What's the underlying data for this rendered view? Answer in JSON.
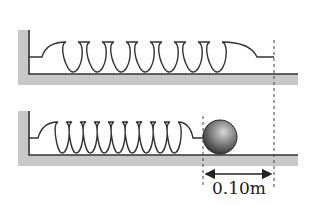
{
  "diagram": {
    "colors": {
      "wall_fill": "#c8c8c8",
      "line": "#333333",
      "ball_dark": "#3a3a3a",
      "ball_light": "#bdbdbd"
    },
    "top_system": {
      "state": "natural length",
      "spring_loops": 7
    },
    "bottom_system": {
      "state": "compressed, ball attached",
      "spring_loops": 9
    },
    "displacement": {
      "label": "0.10m",
      "value": 0.1,
      "unit": "m"
    }
  }
}
